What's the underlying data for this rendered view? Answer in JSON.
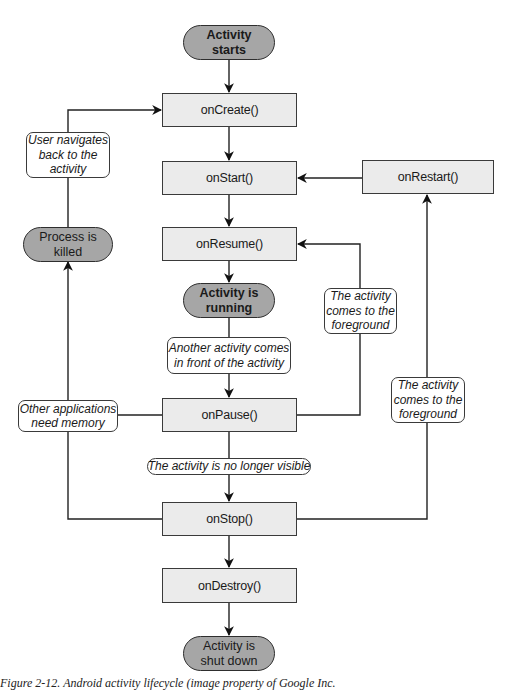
{
  "diagram": {
    "title": "Android activity lifecycle",
    "states": {
      "activity_starts": "Activity starts",
      "activity_running": "Activity is running",
      "process_killed": "Process is killed",
      "activity_shut_down": "Activity is shut down"
    },
    "states_lines": {
      "activity_starts": [
        "Activity",
        "starts"
      ],
      "activity_running": [
        "Activity is",
        "running"
      ],
      "process_killed": [
        "Process is",
        "killed"
      ],
      "activity_shut_down": [
        "Activity is",
        "shut down"
      ]
    },
    "methods": {
      "on_create": "onCreate()",
      "on_start": "onStart()",
      "on_restart": "onRestart()",
      "on_resume": "onResume()",
      "on_pause": "onPause()",
      "on_stop": "onStop()",
      "on_destroy": "onDestroy()"
    },
    "transitions": {
      "user_navigates_back": [
        "User navigates",
        "back to the",
        "activity"
      ],
      "another_activity": [
        "Another activity comes",
        "in front of the activity"
      ],
      "other_apps_memory": [
        "Other applications",
        "need memory"
      ],
      "foreground_resume": [
        "The activity",
        "comes to the",
        "foreground"
      ],
      "foreground_restart": [
        "The activity",
        "comes to the",
        "foreground"
      ],
      "no_longer_visible": "The activity is no longer visible"
    },
    "edges": [
      {
        "from": "Activity starts",
        "to": "onCreate()"
      },
      {
        "from": "onCreate()",
        "to": "onStart()"
      },
      {
        "from": "onStart()",
        "to": "onResume()"
      },
      {
        "from": "onResume()",
        "to": "Activity is running"
      },
      {
        "from": "Activity is running",
        "to": "onPause()",
        "label": "Another activity comes in front of the activity"
      },
      {
        "from": "onPause()",
        "to": "onResume()",
        "label": "The activity comes to the foreground"
      },
      {
        "from": "onPause()",
        "to": "onStop()",
        "label": "The activity is no longer visible"
      },
      {
        "from": "onPause()",
        "to": "Process is killed",
        "label": "Other applications need memory"
      },
      {
        "from": "onStop()",
        "to": "Process is killed",
        "label": "Other applications need memory"
      },
      {
        "from": "Process is killed",
        "to": "onCreate()",
        "label": "User navigates back to the activity"
      },
      {
        "from": "onStop()",
        "to": "onRestart()",
        "label": "The activity comes to the foreground"
      },
      {
        "from": "onRestart()",
        "to": "onStart()"
      },
      {
        "from": "onStop()",
        "to": "onDestroy()"
      },
      {
        "from": "onDestroy()",
        "to": "Activity is shut down"
      }
    ],
    "colors": {
      "method_fill": "#ebebeb",
      "state_fill": "#a6a6a6",
      "stroke": "#2e2e2e",
      "label_fill": "#ffffff"
    }
  },
  "caption": {
    "prefix": "Figure 2-12.",
    "text": "Android activity lifecycle (image property of Google Inc."
  }
}
